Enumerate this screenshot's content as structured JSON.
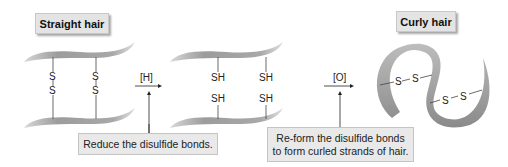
{
  "diagram": {
    "title_left": "Straight hair",
    "title_right": "Curly hair",
    "reagent_reduce": "[H]",
    "reagent_oxidize": "[O]",
    "note_reduce": "Reduce the disulfide bonds.",
    "note_reform_line1": "Re-form the disulfide bonds",
    "note_reform_line2": "to form curled strands of hair.",
    "straight": {
      "bond_top_left": "S",
      "bond_bottom_left": "S",
      "bond_top_right": "S",
      "bond_bottom_right": "S"
    },
    "reduced": {
      "top_left": "SH",
      "bottom_left": "SH",
      "top_right": "SH",
      "bottom_right": "SH"
    },
    "curly": {
      "left_s1": "S",
      "left_s2": "S",
      "right_s1": "S",
      "right_s2": "S"
    },
    "colors": {
      "ribbon": "#9a9a9a",
      "label_bg": "#e4e4e4",
      "text": "#222222"
    }
  }
}
